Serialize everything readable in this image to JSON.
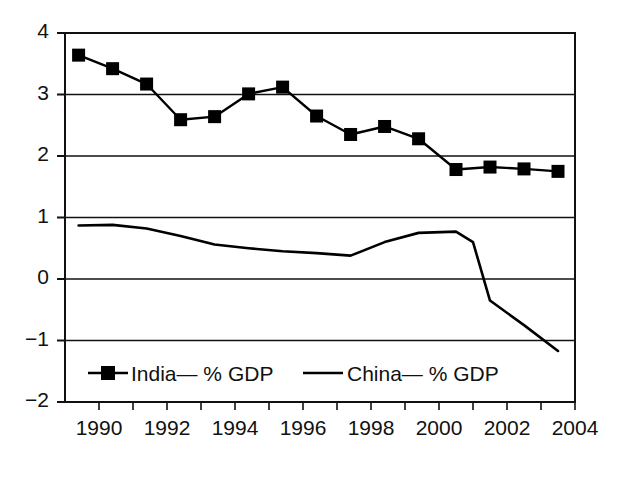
{
  "chart_data": {
    "type": "line",
    "title": "",
    "xlabel": "",
    "ylabel": "",
    "xlim": [
      1989,
      2004
    ],
    "ylim": [
      -2,
      4
    ],
    "ytick_labels": [
      "4",
      "3",
      "2",
      "1",
      "0",
      "−1",
      "−2"
    ],
    "ytick_values": [
      4,
      3,
      2,
      1,
      0,
      -1,
      -2
    ],
    "xtick_labels": [
      "1990",
      "1992",
      "1994",
      "1996",
      "1998",
      "2000",
      "2002",
      "2004"
    ],
    "xtick_values": [
      1990,
      1992,
      1994,
      1996,
      1998,
      2000,
      2002,
      2004
    ],
    "xminor_tick_values": [
      1991,
      1993,
      1995,
      1997,
      1999,
      2001,
      2003
    ],
    "grid": "horizontal",
    "legend_position": "bottom-inside",
    "series": [
      {
        "name": "India— % GDP",
        "marker": "filled-square",
        "color": "#000000",
        "x": [
          1989.4,
          1990.4,
          1991.4,
          1992.4,
          1993.4,
          1994.4,
          1995.4,
          1996.4,
          1997.4,
          1998.4,
          1999.4,
          2000.5,
          2001.5,
          2002.5,
          2003.5
        ],
        "values": [
          3.64,
          3.42,
          3.17,
          2.59,
          2.64,
          3.01,
          3.12,
          2.65,
          2.35,
          2.48,
          2.28,
          1.78,
          1.82,
          1.79,
          1.75
        ]
      },
      {
        "name": "China— % GDP",
        "marker": "none",
        "color": "#000000",
        "x": [
          1989.4,
          1990.4,
          1991.4,
          1992.4,
          1993.4,
          1994.4,
          1995.4,
          1996.4,
          1997.4,
          1998.4,
          1999.4,
          2000.5,
          2001.0,
          2001.5,
          2002.5,
          2003.5
        ],
        "values": [
          0.87,
          0.88,
          0.82,
          0.7,
          0.56,
          0.5,
          0.45,
          0.42,
          0.38,
          0.6,
          0.75,
          0.77,
          0.6,
          -0.35,
          -0.75,
          -1.17
        ]
      }
    ]
  },
  "legend": {
    "items": [
      {
        "label": "India— % GDP",
        "marker": "filled-square"
      },
      {
        "label": "China— % GDP",
        "marker": "line"
      }
    ]
  }
}
